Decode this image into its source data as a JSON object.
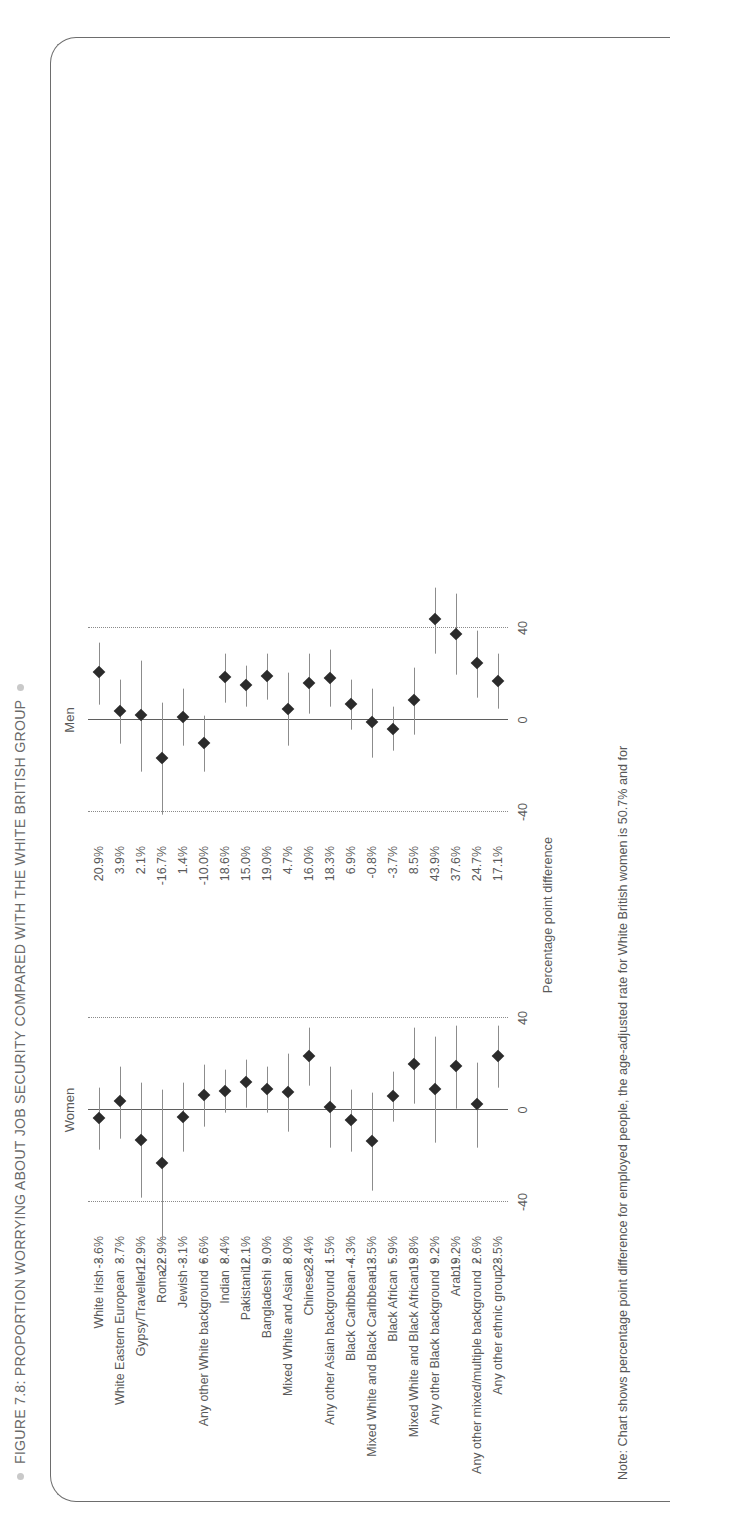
{
  "figure": {
    "title": "FIGURE 7.8: PROPORTION WORRYING ABOUT JOB SECURITY COMPARED WITH THE WHITE BRITISH GROUP",
    "note": "Note: Chart shows percentage point difference for employed people, the age-adjusted rate for White British women is 50.7% and for",
    "axis_caption": "Percentage point difference",
    "panel_women": "Women",
    "panel_men": "Men"
  },
  "colors": {
    "dot": "#2b2b2b",
    "ci": "#8c8c8c",
    "zero_line": "#5f5f5f",
    "grid": "#8a8a8a",
    "text": "#595959",
    "title": "#6b6b6b",
    "card": "#6d6d6d"
  },
  "chart_data": {
    "type": "scatter",
    "title": "FIGURE 7.8: PROPORTION WORRYING ABOUT JOB SECURITY COMPARED WITH THE WHITE BRITISH GROUP",
    "xlabel": "Percentage point difference",
    "ylabel": "",
    "xlim": [
      -60,
      60
    ],
    "xticks": [
      -40,
      0,
      40
    ],
    "xtick_labels": [
      "-40",
      "0",
      "40"
    ],
    "grid": "dotted vertical gridlines at -40 and 40; solid reference line at 0",
    "legend": "none",
    "panels": [
      "Women",
      "Men"
    ],
    "categories": [
      "White Irish",
      "White Eastern European",
      "Gypsy/Traveller",
      "Roma",
      "Jewish",
      "Any other White background",
      "Indian",
      "Pakistani",
      "Bangladeshi",
      "Mixed White and Asian",
      "Chinese",
      "Any other Asian background",
      "Black Caribbean",
      "Mixed White and Black Caribbean",
      "Black African",
      "Mixed White and Black African",
      "Any other Black background",
      "Arab",
      "Any other mixed/multiple background",
      "Any other ethnic group"
    ],
    "series": [
      {
        "name": "Women",
        "value_labels": [
          "-3.6%",
          "3.7%",
          "-12.9%",
          "-22.9%",
          "-3.1%",
          "6.6%",
          "8.4%",
          "12.1%",
          "9.0%",
          "8.0%",
          "23.4%",
          "1.5%",
          "-4.3%",
          "-13.5%",
          "5.9%",
          "19.8%",
          "9.2%",
          "19.2%",
          "2.6%",
          "23.5%"
        ],
        "values": [
          -3.6,
          3.7,
          -12.9,
          -22.9,
          -3.1,
          6.6,
          8.4,
          12.1,
          9.0,
          8.0,
          23.4,
          1.5,
          -4.3,
          -13.5,
          5.9,
          19.8,
          9.2,
          19.2,
          2.6,
          23.5
        ],
        "ci_low": [
          -17.0,
          -12.0,
          -38.0,
          -56.0,
          -18.0,
          -7.0,
          -1.0,
          1.5,
          -1.0,
          -9.0,
          11.0,
          -16.0,
          -18.0,
          -35.0,
          -5.0,
          3.0,
          -14.0,
          1.0,
          -16.0,
          10.0
        ],
        "ci_high": [
          10.0,
          19.0,
          12.0,
          9.0,
          12.0,
          20.0,
          18.0,
          22.0,
          19.0,
          25.0,
          36.0,
          19.0,
          9.0,
          8.0,
          17.0,
          36.0,
          32.0,
          37.0,
          21.0,
          37.0
        ]
      },
      {
        "name": "Men",
        "value_labels": [
          "20.9%",
          "3.9%",
          "2.1%",
          "-16.7%",
          "1.4%",
          "-10.0%",
          "18.6%",
          "15.0%",
          "19.0%",
          "4.7%",
          "16.0%",
          "18.3%",
          "6.9%",
          "-0.8%",
          "-3.7%",
          "8.5%",
          "43.9%",
          "37.6%",
          "24.7%",
          "17.1%"
        ],
        "values": [
          20.9,
          3.9,
          2.1,
          -16.7,
          1.4,
          -10.0,
          18.6,
          15.0,
          19.0,
          4.7,
          16.0,
          18.3,
          6.9,
          -0.8,
          -3.7,
          8.5,
          43.9,
          37.6,
          24.7,
          17.1
        ],
        "ci_low": [
          7.0,
          -10.0,
          -22.0,
          -41.0,
          -11.0,
          -22.0,
          8.0,
          6.0,
          9.0,
          -11.0,
          3.0,
          6.0,
          -4.0,
          -16.0,
          -13.0,
          -6.0,
          29.0,
          20.0,
          10.0,
          5.0
        ],
        "ci_high": [
          34.0,
          18.0,
          26.0,
          8.0,
          14.0,
          2.0,
          29.0,
          24.0,
          29.0,
          21.0,
          29.0,
          31.0,
          18.0,
          14.0,
          6.0,
          23.0,
          58.0,
          55.0,
          39.0,
          29.0
        ]
      }
    ]
  }
}
